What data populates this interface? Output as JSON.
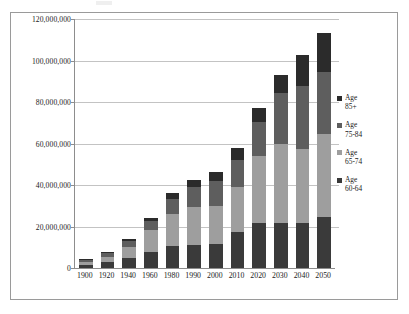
{
  "chart_data": {
    "type": "bar",
    "subtype": "stacked-column",
    "title": "",
    "subtitle": "",
    "xlabel": "",
    "ylabel": "",
    "categories": [
      "1900",
      "1920",
      "1940",
      "1960",
      "1980",
      "1990",
      "2000",
      "2010",
      "2020",
      "2030",
      "2040",
      "2050"
    ],
    "series": [
      {
        "name": "Age 60-64",
        "legend_label_line1": "Age",
        "legend_label_line2": "60-64",
        "color": "#3a3a3a",
        "values": [
          1500000,
          2800000,
          4800000,
          7500000,
          10500000,
          11200000,
          11500000,
          17500000,
          21500000,
          21500000,
          21500000,
          24500000
        ]
      },
      {
        "name": "Age 65-74",
        "legend_label_line1": "Age",
        "legend_label_line2": "65-74",
        "color": "#9e9e9e",
        "values": [
          1500000,
          2500000,
          5500000,
          11000000,
          15500000,
          18000000,
          18500000,
          21500000,
          32500000,
          38500000,
          36000000,
          40000000
        ]
      },
      {
        "name": "Age 75-84",
        "legend_label_line1": "Age",
        "legend_label_line2": "75-84",
        "color": "#5e5e5e",
        "values": [
          1000000,
          1800000,
          2800000,
          4000000,
          7500000,
          10000000,
          12000000,
          13000000,
          16500000,
          24500000,
          30000000,
          30000000
        ]
      },
      {
        "name": "Age 85+",
        "legend_label_line1": "Age",
        "legend_label_line2": "85+",
        "color": "#2b2b2b",
        "values": [
          300000,
          500000,
          900000,
          1500000,
          2500000,
          3000000,
          4200000,
          6000000,
          6500000,
          8500000,
          15000000,
          19000000
        ]
      }
    ],
    "totals": [
      4300000,
      7600000,
      14000000,
      24000000,
      36000000,
      42200000,
      46200000,
      58000000,
      77000000,
      93000000,
      102500000,
      113500000
    ],
    "y_ticks": [
      0,
      20000000,
      40000000,
      60000000,
      80000000,
      100000000,
      120000000
    ],
    "y_tick_labels": [
      "0",
      "20,000,000",
      "40,000,000",
      "60,000,000",
      "80,000,000",
      "100,000,000",
      "120,000,000"
    ],
    "ylim": [
      0,
      120000000
    ],
    "grid": true,
    "legend_position": "right"
  },
  "colors": {
    "frame_border": "#9a9a9a",
    "axis_line": "#8d8d8d",
    "gridline": "#c3c3c3",
    "background": "#ffffff",
    "text": "#1a1a1a"
  }
}
